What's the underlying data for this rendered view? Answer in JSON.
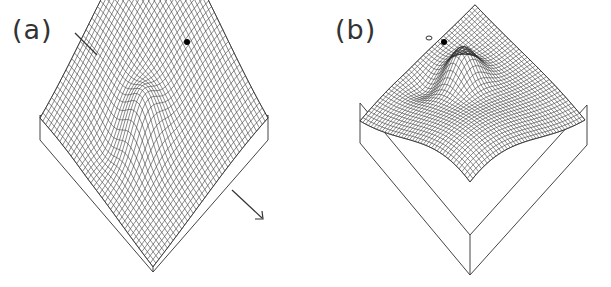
{
  "figure": {
    "panels": [
      {
        "label": "(a)",
        "description": "3D mesh surface plot with ridge and local bump; marker dot near peak; arrow annotation at lower right"
      },
      {
        "label": "(b)",
        "description": "3D mesh surface plot, mirrored view with ridge and local bump; marker dot near peak"
      }
    ]
  },
  "colors": {
    "mesh": "#2a2a2a",
    "box": "#444444",
    "background": "#ffffff"
  }
}
